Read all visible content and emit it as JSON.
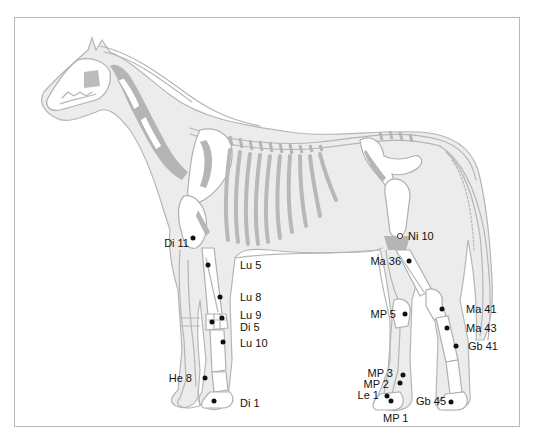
{
  "figure": {
    "colors": {
      "outline": "#b5b5b5",
      "body_fill": "#ececec",
      "bone_fill": "#ffffff",
      "bone_shadow": "#b0b0b0",
      "point": "#111111",
      "frame": "#b8b8b8"
    }
  },
  "points": [
    {
      "id": "di11",
      "label": "Di 11",
      "x": 193,
      "y": 238,
      "lx": 189,
      "ly": 243,
      "side": "left",
      "type": "filled"
    },
    {
      "id": "lu5",
      "label": "Lu 5",
      "x": 208,
      "y": 265,
      "lx": 240,
      "ly": 265,
      "side": "right",
      "type": "filled"
    },
    {
      "id": "lu8",
      "label": "Lu 8",
      "x": 220,
      "y": 297,
      "lx": 240,
      "ly": 297,
      "side": "right",
      "type": "filled"
    },
    {
      "id": "lu9",
      "label": "Lu 9",
      "x": 222,
      "y": 318,
      "lx": 240,
      "ly": 315,
      "side": "right",
      "type": "filled"
    },
    {
      "id": "di5",
      "label": "Di 5",
      "x": 212,
      "y": 322,
      "lx": 240,
      "ly": 327,
      "side": "right",
      "type": "filled"
    },
    {
      "id": "lu10",
      "label": "Lu 10",
      "x": 223,
      "y": 342,
      "lx": 240,
      "ly": 343,
      "side": "right",
      "type": "filled"
    },
    {
      "id": "he8",
      "label": "He 8",
      "x": 205,
      "y": 378,
      "lx": 192,
      "ly": 378,
      "side": "left",
      "type": "filled"
    },
    {
      "id": "di1",
      "label": "Di 1",
      "x": 214,
      "y": 401,
      "lx": 240,
      "ly": 403,
      "side": "right",
      "type": "filled"
    },
    {
      "id": "ni10",
      "label": "Ni 10",
      "x": 400,
      "y": 236,
      "lx": 408,
      "ly": 236,
      "side": "right",
      "type": "hollow"
    },
    {
      "id": "ma36",
      "label": "Ma 36",
      "x": 409,
      "y": 261,
      "lx": 401,
      "ly": 261,
      "side": "left",
      "type": "filled"
    },
    {
      "id": "ma41",
      "label": "Ma 41",
      "x": 442,
      "y": 309,
      "lx": 466,
      "ly": 309,
      "side": "right",
      "type": "filled"
    },
    {
      "id": "ma43",
      "label": "Ma 43",
      "x": 447,
      "y": 328,
      "lx": 466,
      "ly": 328,
      "side": "right",
      "type": "filled"
    },
    {
      "id": "gb41",
      "label": "Gb 41",
      "x": 456,
      "y": 346,
      "lx": 468,
      "ly": 346,
      "side": "right",
      "type": "filled"
    },
    {
      "id": "mp5",
      "label": "MP 5",
      "x": 405,
      "y": 314,
      "lx": 396,
      "ly": 314,
      "side": "left",
      "type": "filled"
    },
    {
      "id": "mp3",
      "label": "MP 3",
      "x": 403,
      "y": 375,
      "lx": 393,
      "ly": 373,
      "side": "left",
      "type": "filled"
    },
    {
      "id": "mp2",
      "label": "MP 2",
      "x": 400,
      "y": 383,
      "lx": 389,
      "ly": 384,
      "side": "left",
      "type": "filled"
    },
    {
      "id": "le1",
      "label": "Le 1",
      "x": 387,
      "y": 396,
      "lx": 379,
      "ly": 395,
      "side": "left",
      "type": "filled"
    },
    {
      "id": "mp1",
      "label": "MP 1",
      "x": 391,
      "y": 401,
      "lx": 383,
      "ly": 418,
      "side": "below",
      "type": "filled"
    },
    {
      "id": "gb45",
      "label": "Gb 45",
      "x": 451,
      "y": 402,
      "lx": 446,
      "ly": 401,
      "side": "left",
      "type": "filled"
    }
  ]
}
